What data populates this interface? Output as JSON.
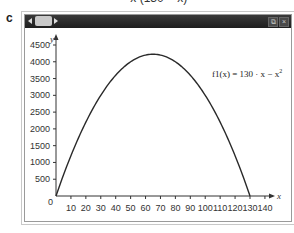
{
  "panel_label": "c",
  "top_fragment": "= x (130 − x)",
  "window": {
    "titlebar": {
      "nav_left": "◀",
      "nav_right": "▶",
      "restore_button": "⧉",
      "close_button": "×"
    }
  },
  "chart_data": {
    "type": "line",
    "title": "",
    "xlabel": "x",
    "ylabel": "y",
    "x_ticks": [
      10,
      20,
      30,
      40,
      50,
      60,
      70,
      80,
      90,
      100,
      110,
      120,
      130,
      140
    ],
    "y_ticks": [
      500,
      1000,
      1500,
      2000,
      2500,
      3000,
      3500,
      4000,
      4500
    ],
    "origin_label": "0",
    "xlim": [
      0,
      145
    ],
    "ylim": [
      0,
      4700
    ],
    "grid": false,
    "legend": "none",
    "annotation": {
      "text_prefix": "f1(x) = 130 · x − x",
      "superscript": "2"
    },
    "series": [
      {
        "name": "f1(x) = 130·x − x²",
        "x": [
          0,
          10,
          20,
          30,
          40,
          50,
          60,
          65,
          70,
          80,
          90,
          100,
          110,
          120,
          130
        ],
        "values": [
          0,
          1200,
          2200,
          3000,
          3600,
          4000,
          4200,
          4225,
          4200,
          4000,
          3600,
          3000,
          2200,
          1200,
          0
        ]
      }
    ]
  }
}
